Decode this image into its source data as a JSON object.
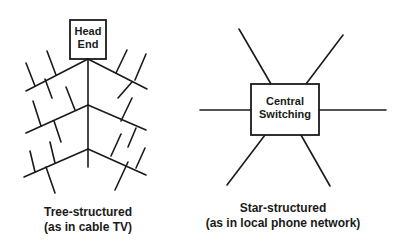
{
  "diagrams": {
    "tree": {
      "root_label_line1": "Head",
      "root_label_line2": "End",
      "caption_line1": "Tree-structured",
      "caption_line2": "(as in cable TV)"
    },
    "star": {
      "center_label_line1": "Central",
      "center_label_line2": "Switching",
      "caption_line1": "Star-structured",
      "caption_line2": "(as in local phone network)",
      "spoke_count": 6
    }
  },
  "colors": {
    "line": "#1a1a1a",
    "background": "#ffffff"
  }
}
